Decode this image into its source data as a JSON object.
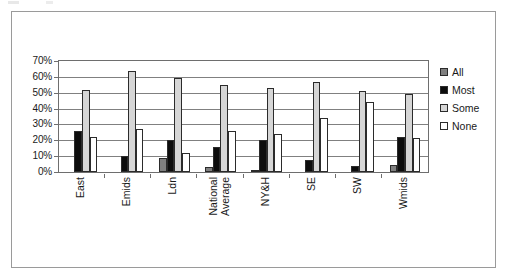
{
  "chart_data": {
    "type": "bar",
    "title": "",
    "subtitle": "",
    "xlabel": "",
    "ylabel": "",
    "ylim": [
      0,
      70
    ],
    "ytick_labels": [
      "70%",
      "60%",
      "50%",
      "40%",
      "30%",
      "20%",
      "10%",
      "0%"
    ],
    "ytick_values": [
      70,
      60,
      50,
      40,
      30,
      20,
      10,
      0
    ],
    "grid": true,
    "grid_axis": "y",
    "legend_position": "right",
    "categories": [
      "East",
      "Emids",
      "Ldn",
      "National Average",
      "NY&H",
      "SE",
      "SW",
      "Wmids"
    ],
    "category_lines": [
      [
        "East"
      ],
      [
        "Emids"
      ],
      [
        "Ldn"
      ],
      [
        "National",
        "Average"
      ],
      [
        "NY&H"
      ],
      [
        "SE"
      ],
      [
        "SW"
      ],
      [
        "Wmids"
      ]
    ],
    "series": [
      {
        "name": "All",
        "color": "#808080",
        "values": [
          0,
          0,
          9,
          3,
          1.5,
          0,
          0,
          4.5
        ]
      },
      {
        "name": "Most",
        "color": "#0d0d0d",
        "values": [
          26,
          10,
          20,
          16,
          20,
          7.5,
          3.5,
          22
        ]
      },
      {
        "name": "Some",
        "color": "#d6d6d6",
        "values": [
          52,
          64,
          59,
          55,
          53,
          57,
          51,
          49.5
        ]
      },
      {
        "name": "None",
        "color": "#ffffff",
        "values": [
          22,
          27,
          12,
          26,
          24,
          34,
          44,
          21.5
        ]
      }
    ]
  },
  "legend": {
    "items": [
      {
        "label": "All",
        "series": "All"
      },
      {
        "label": "Most",
        "series": "Most"
      },
      {
        "label": "Some",
        "series": "Some"
      },
      {
        "label": "None",
        "series": "None"
      }
    ]
  },
  "colors": {
    "all": "#808080",
    "most": "#0d0d0d",
    "some": "#d6d6d6",
    "none": "#ffffff",
    "axis": "#6e6e6e",
    "grid": "#808080",
    "frame": "#9a9a9a",
    "text": "#1a1a1a"
  }
}
